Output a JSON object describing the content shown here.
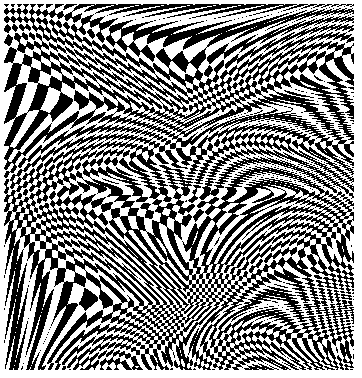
{
  "artwork": {
    "title": "Op-art warped diamond checkerboard",
    "style": "op-art optical illusion",
    "colors": {
      "background": "#ffffff",
      "dark": "#000000",
      "light": "#ffffff"
    },
    "canvas": {
      "x": 4,
      "y": 4,
      "width": 350,
      "height": 366
    },
    "pattern": {
      "type": "diamond-checkerboard",
      "rotation_deg": 45,
      "base_cell_px": 26,
      "min_cell_px": 5,
      "vertical_stretch": 1.25
    },
    "pinch_lines": [
      {
        "from": [
          0,
          0
        ],
        "to": [
          182,
          112
        ]
      },
      {
        "from": [
          352,
          0
        ],
        "to": [
          182,
          112
        ]
      },
      {
        "from": [
          182,
          112
        ],
        "to": [
          0,
          178
        ]
      },
      {
        "from": [
          182,
          112
        ],
        "to": [
          352,
          178
        ]
      },
      {
        "from": [
          0,
          178
        ],
        "to": [
          182,
          300
        ]
      },
      {
        "from": [
          352,
          178
        ],
        "to": [
          182,
          300
        ]
      },
      {
        "from": [
          182,
          300
        ],
        "to": [
          60,
          370
        ]
      },
      {
        "from": [
          182,
          300
        ],
        "to": [
          300,
          370
        ]
      }
    ],
    "pinch_width_px": 38,
    "pinch_strength": 0.8
  }
}
